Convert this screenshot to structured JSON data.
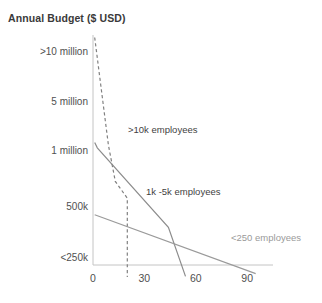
{
  "chart_data": {
    "type": "line",
    "title": "Annual Budget ($ USD)",
    "xlabel": "",
    "ylabel": "Annual Budget ($ USD)",
    "x_ticks": [
      "0",
      "30",
      "60",
      "90"
    ],
    "x_tick_values": [
      0,
      30,
      60,
      90
    ],
    "xlim": [
      0,
      105
    ],
    "y_ticks": [
      ">10 million",
      "5 million",
      "1 million",
      "500k",
      "<250k"
    ],
    "y_tick_values": [
      5,
      4,
      3,
      2,
      1
    ],
    "ylim": [
      0.6,
      5.2
    ],
    "grid": false,
    "legend": "inline-annotations",
    "series": [
      {
        "name": ">10k employees",
        "style": "dashed",
        "color": "#808080",
        "label_x": 128,
        "label_y": 124,
        "points": [
          [
            1.0,
            5.15
          ],
          [
            9.0,
            3.0
          ],
          [
            13.0,
            2.35
          ],
          [
            20.0,
            2.05
          ],
          [
            20.0,
            0.62
          ]
        ]
      },
      {
        "name": "1k -5k employees",
        "style": "solid",
        "color": "#8c8c8c",
        "label_x": 146,
        "label_y": 186,
        "points": [
          [
            1.0,
            3.05
          ],
          [
            2.5,
            2.95
          ],
          [
            44.0,
            1.52
          ],
          [
            54.0,
            0.63
          ]
        ]
      },
      {
        "name": "<250 employees",
        "style": "solid",
        "color": "#9a9a9a",
        "label_x": 231,
        "label_y": 232,
        "points": [
          [
            1.0,
            1.75
          ],
          [
            95.0,
            0.68
          ]
        ]
      }
    ]
  },
  "axes": {
    "axis_color": "#bfbfbf",
    "origin_px": {
      "x": 93,
      "y": 265
    },
    "x_px_per_unit": 1.713,
    "y_top_px": 35
  }
}
